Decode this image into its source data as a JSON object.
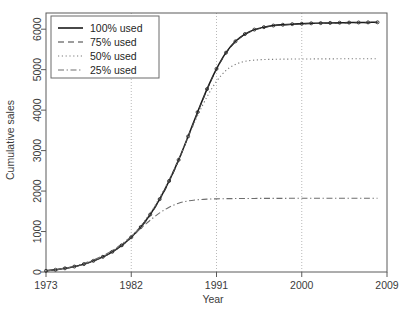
{
  "chart_data": {
    "type": "line",
    "title": "",
    "xlabel": "Year",
    "ylabel": "Cumulative sales",
    "xlim": [
      1973,
      2009
    ],
    "ylim": [
      0,
      6400
    ],
    "xticks": [
      1973,
      1982,
      1991,
      2000,
      2009
    ],
    "yticks": [
      0,
      1000,
      2000,
      3000,
      4000,
      5000,
      6000
    ],
    "gridlines_x": [
      1982,
      1991,
      2000
    ],
    "grid": "vertical-dotted",
    "legend_position": "top-left",
    "x": [
      1973,
      1974,
      1975,
      1976,
      1977,
      1978,
      1979,
      1980,
      1981,
      1982,
      1983,
      1984,
      1985,
      1986,
      1987,
      1988,
      1989,
      1990,
      1991,
      1992,
      1993,
      1994,
      1995,
      1996,
      1997,
      1998,
      1999,
      2000,
      2001,
      2002,
      2003,
      2004,
      2005,
      2006,
      2007,
      2008
    ],
    "series": [
      {
        "name": "100% used",
        "style": "solid",
        "color": "#1a1a1a",
        "markers": true,
        "values": [
          30,
          55,
          90,
          135,
          195,
          275,
          375,
          500,
          660,
          860,
          1110,
          1420,
          1800,
          2250,
          2770,
          3350,
          3950,
          4520,
          5020,
          5420,
          5700,
          5880,
          5990,
          6050,
          6090,
          6110,
          6125,
          6135,
          6145,
          6150,
          6155,
          6160,
          6163,
          6166,
          6168,
          6170
        ]
      },
      {
        "name": "75% used",
        "style": "dashed",
        "color": "#3d3d3d",
        "markers": false,
        "values": [
          28,
          52,
          86,
          130,
          190,
          268,
          366,
          492,
          650,
          850,
          1098,
          1405,
          1785,
          2235,
          2755,
          3335,
          3935,
          4505,
          5005,
          5405,
          5685,
          5865,
          5978,
          6040,
          6082,
          6103,
          6118,
          6128,
          6138,
          6143,
          6148,
          6153,
          6156,
          6159,
          6161,
          6163
        ]
      },
      {
        "name": "50% used",
        "style": "dotted",
        "color": "#7a7a7a",
        "markers": false,
        "values": [
          30,
          55,
          92,
          140,
          200,
          282,
          385,
          515,
          680,
          885,
          1140,
          1455,
          1840,
          2285,
          2790,
          3330,
          3860,
          4330,
          4710,
          4980,
          5130,
          5205,
          5235,
          5250,
          5255,
          5260,
          5262,
          5264,
          5265,
          5266,
          5267,
          5268,
          5268,
          5269,
          5269,
          5270
        ]
      },
      {
        "name": "25% used",
        "style": "dashdot",
        "color": "#6e6e6e",
        "markers": false,
        "values": [
          32,
          58,
          96,
          148,
          212,
          296,
          402,
          530,
          690,
          880,
          1080,
          1280,
          1460,
          1600,
          1700,
          1755,
          1785,
          1800,
          1808,
          1812,
          1815,
          1817,
          1818,
          1819,
          1820,
          1820,
          1821,
          1821,
          1821,
          1822,
          1822,
          1822,
          1822,
          1822,
          1822,
          1822
        ]
      }
    ]
  },
  "legend": {
    "items": [
      {
        "label": "100% used"
      },
      {
        "label": "75% used"
      },
      {
        "label": "50% used"
      },
      {
        "label": "25% used"
      }
    ]
  },
  "axes": {
    "x_title": "Year",
    "y_title": "Cumulative sales",
    "x_tick_labels": [
      "1973",
      "1982",
      "1991",
      "2000",
      "2009"
    ],
    "y_tick_labels": [
      "0",
      "1000",
      "2000",
      "3000",
      "4000",
      "5000",
      "6000"
    ]
  }
}
